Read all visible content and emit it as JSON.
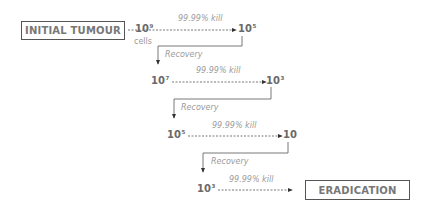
{
  "diagram": {
    "start_box": "INITIAL TUMOUR",
    "end_box": "ERADICATION",
    "cells_label": "cells",
    "kill_label": "99.99% kill",
    "recovery_label": "Recovery",
    "steps": [
      {
        "from_base": "10",
        "from_exp": "9",
        "to_base": "10",
        "to_exp": "5",
        "kill": "99.99% kill"
      },
      {
        "from_base": "10",
        "from_exp": "7",
        "to_base": "10",
        "to_exp": "3",
        "kill": "99.99% kill",
        "recovery": "Recovery"
      },
      {
        "from_base": "10",
        "from_exp": "5",
        "to_base": "10",
        "to_exp": "",
        "kill": "99.99% kill",
        "recovery": "Recovery"
      },
      {
        "from_base": "10",
        "from_exp": "3",
        "to": "ERADICATION",
        "kill": "99.99% kill",
        "recovery": "Recovery"
      }
    ]
  }
}
